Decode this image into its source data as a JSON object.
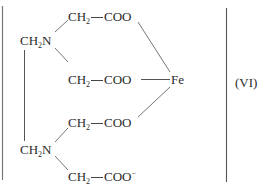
{
  "diagram": {
    "type": "chemical-structure",
    "label": "(VI)",
    "metal_center": "Fe",
    "groups": {
      "amine_top": {
        "prefix": "CH",
        "sub": "2",
        "suffix": "N"
      },
      "amine_bottom": {
        "prefix": "CH",
        "sub": "2",
        "suffix": "N"
      },
      "arm1": {
        "ch": "CH",
        "sub": "2",
        "coo": "COO"
      },
      "arm2": {
        "ch": "CH",
        "sub": "2",
        "coo": "COO"
      },
      "arm3": {
        "ch": "CH",
        "sub": "2",
        "coo": "COO"
      },
      "arm4": {
        "ch": "CH",
        "sub": "2",
        "coo": "COO",
        "charge": "−"
      }
    },
    "colors": {
      "ink": "#2a2a2a",
      "background": "#ffffff"
    }
  }
}
